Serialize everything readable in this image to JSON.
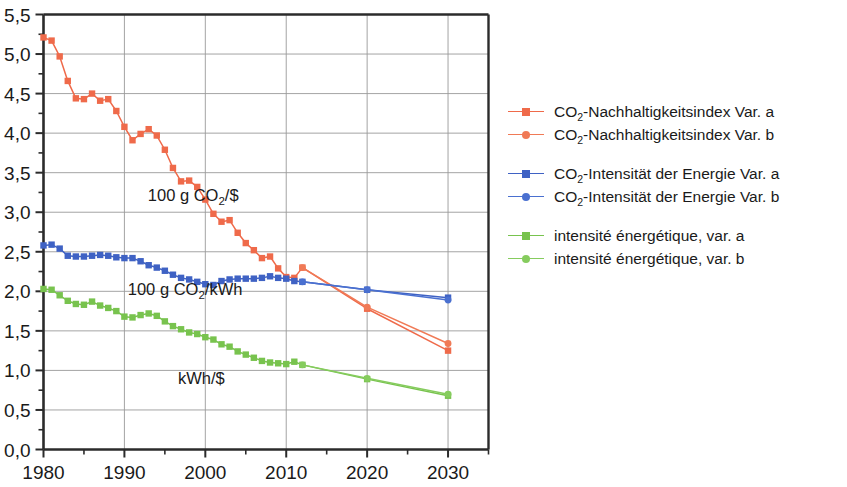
{
  "chart_data": {
    "type": "line",
    "title": "",
    "xlabel": "",
    "ylabel": "",
    "xlim": [
      1980,
      2035
    ],
    "ylim": [
      0.0,
      5.5
    ],
    "grid": true,
    "legend_position": "right",
    "decimal_separator": ",",
    "x_ticks": [
      1980,
      1990,
      2000,
      2010,
      2020,
      2030
    ],
    "x_tick_labels": [
      "1980",
      "1990",
      "2000",
      "2010",
      "2020",
      "2030"
    ],
    "x_minor_ticks": [
      1985,
      1995,
      2005,
      2015,
      2025,
      2035
    ],
    "y_ticks": [
      0.0,
      0.5,
      1.0,
      1.5,
      2.0,
      2.5,
      3.0,
      3.5,
      4.0,
      4.5,
      5.0,
      5.5
    ],
    "y_tick_labels": [
      "0,0",
      "0,5",
      "1,0",
      "1,5",
      "2,0",
      "2,5",
      "3,0",
      "3,5",
      "4,0",
      "4,5",
      "5,0",
      "5,5"
    ],
    "y_minor_ticks": [
      0.25,
      0.75,
      1.25,
      1.75,
      2.25,
      2.75,
      3.25,
      3.75,
      4.25,
      4.75,
      5.25
    ],
    "colors": {
      "red": "#ef6a4a",
      "red_b": "#f07a56",
      "blue": "#3f62c4",
      "blue_b": "#4a70d0",
      "green": "#78c34e",
      "green_b": "#86cc5e",
      "gridline": "#9a9a9a",
      "axis": "#2b2b2b",
      "text": "#1a1a1a"
    },
    "annotations": [
      {
        "text": "100 g CO2/$",
        "text_main": "100 g CO",
        "text_sub": "2",
        "text_tail": "/$",
        "x": 1998.5,
        "y": 3.14
      },
      {
        "text": "100 g CO2/kWh",
        "text_main": "100 g CO",
        "text_sub": "2",
        "text_tail": "/kWh",
        "x": 1997.5,
        "y": 1.95
      },
      {
        "text": "kWh/$",
        "text_main": "kWh/$",
        "text_sub": "",
        "text_tail": "",
        "x": 1999.5,
        "y": 0.83
      }
    ],
    "series": [
      {
        "name": "CO2-Nachhaltigkeitsindex Var. a",
        "label_main": "CO",
        "label_sub": "2",
        "label_tail": "-Nachhaltigkeitsindex Var. a",
        "color": "#ef6a4a",
        "marker": "square",
        "x": [
          1980,
          1981,
          1982,
          1983,
          1984,
          1985,
          1986,
          1987,
          1988,
          1989,
          1990,
          1991,
          1992,
          1993,
          1994,
          1995,
          1996,
          1997,
          1998,
          1999,
          2000,
          2001,
          2002,
          2003,
          2004,
          2005,
          2006,
          2007,
          2008,
          2009,
          2010,
          2011,
          2012,
          2020,
          2030
        ],
        "y": [
          5.21,
          5.17,
          4.97,
          4.66,
          4.44,
          4.43,
          4.5,
          4.41,
          4.43,
          4.28,
          4.08,
          3.91,
          3.99,
          4.05,
          3.97,
          3.79,
          3.56,
          3.39,
          3.4,
          3.32,
          3.16,
          2.98,
          2.88,
          2.9,
          2.74,
          2.61,
          2.52,
          2.42,
          2.44,
          2.29,
          2.18,
          2.17,
          2.3,
          1.78,
          1.25
        ]
      },
      {
        "name": "CO2-Nachhaltigkeitsindex Var. b",
        "label_main": "CO",
        "label_sub": "2",
        "label_tail": "-Nachhaltigkeitsindex Var. b",
        "color": "#f07a56",
        "marker": "round",
        "x": [
          2012,
          2020,
          2030
        ],
        "y": [
          2.3,
          1.8,
          1.34
        ]
      },
      {
        "name": "CO2-Intensitat der Energie Var. a",
        "label_main": "CO",
        "label_sub": "2",
        "label_tail": "-Intensität der Energie Var. a",
        "color": "#3f62c4",
        "marker": "square",
        "x": [
          1980,
          1981,
          1982,
          1983,
          1984,
          1985,
          1986,
          1987,
          1988,
          1989,
          1990,
          1991,
          1992,
          1993,
          1994,
          1995,
          1996,
          1997,
          1998,
          1999,
          2000,
          2001,
          2002,
          2003,
          2004,
          2005,
          2006,
          2007,
          2008,
          2009,
          2010,
          2011,
          2012,
          2020,
          2030
        ],
        "y": [
          2.58,
          2.59,
          2.54,
          2.45,
          2.44,
          2.44,
          2.45,
          2.46,
          2.45,
          2.43,
          2.42,
          2.42,
          2.38,
          2.33,
          2.3,
          2.26,
          2.21,
          2.17,
          2.15,
          2.12,
          2.09,
          2.08,
          2.13,
          2.15,
          2.16,
          2.16,
          2.16,
          2.17,
          2.19,
          2.17,
          2.16,
          2.13,
          2.12,
          2.02,
          1.92
        ]
      },
      {
        "name": "CO2-Intensitat der Energie Var. b",
        "label_main": "CO",
        "label_sub": "2",
        "label_tail": "-Intensität der Energie Var. b",
        "color": "#4a70d0",
        "marker": "round",
        "x": [
          2012,
          2020,
          2030
        ],
        "y": [
          2.12,
          2.02,
          1.89
        ]
      },
      {
        "name": "intensite energetique, var. a",
        "label_main": "intensité énergétique, var. a",
        "label_sub": "",
        "label_tail": "",
        "color": "#78c34e",
        "marker": "square",
        "x": [
          1980,
          1981,
          1982,
          1983,
          1984,
          1985,
          1986,
          1987,
          1988,
          1989,
          1990,
          1991,
          1992,
          1993,
          1994,
          1995,
          1996,
          1997,
          1998,
          1999,
          2000,
          2001,
          2002,
          2003,
          2004,
          2005,
          2006,
          2007,
          2008,
          2009,
          2010,
          2011,
          2012,
          2020,
          2030
        ],
        "y": [
          2.03,
          2.02,
          1.95,
          1.88,
          1.84,
          1.83,
          1.87,
          1.82,
          1.79,
          1.75,
          1.68,
          1.67,
          1.7,
          1.72,
          1.69,
          1.62,
          1.56,
          1.52,
          1.48,
          1.46,
          1.42,
          1.39,
          1.33,
          1.3,
          1.24,
          1.2,
          1.16,
          1.12,
          1.1,
          1.09,
          1.08,
          1.11,
          1.07,
          0.89,
          0.68
        ]
      },
      {
        "name": "intensite energetique, var. b",
        "label_main": "intensité énergétique, var. b",
        "label_sub": "",
        "label_tail": "",
        "color": "#86cc5e",
        "marker": "round",
        "x": [
          2012,
          2020,
          2030
        ],
        "y": [
          1.07,
          0.9,
          0.7
        ]
      }
    ]
  },
  "legend": {
    "groups": [
      {
        "rows": [
          {
            "main": "CO",
            "sub": "2",
            "tail": "-Nachhaltigkeitsindex Var. a",
            "color": "#ef6a4a",
            "marker": "square"
          },
          {
            "main": "CO",
            "sub": "2",
            "tail": "-Nachhaltigkeitsindex Var. b",
            "color": "#f07a56",
            "marker": "round"
          }
        ]
      },
      {
        "rows": [
          {
            "main": "CO",
            "sub": "2",
            "tail": "-Intensität der Energie Var. a",
            "color": "#3f62c4",
            "marker": "square"
          },
          {
            "main": "CO",
            "sub": "2",
            "tail": "-Intensität der Energie Var. b",
            "color": "#4a70d0",
            "marker": "round"
          }
        ]
      },
      {
        "rows": [
          {
            "main": "intensité énergétique, var. a",
            "sub": "",
            "tail": "",
            "color": "#78c34e",
            "marker": "square"
          },
          {
            "main": "intensité énergétique, var. b",
            "sub": "",
            "tail": "",
            "color": "#86cc5e",
            "marker": "round"
          }
        ]
      }
    ]
  }
}
